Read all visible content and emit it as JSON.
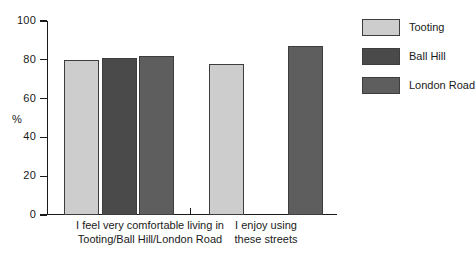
{
  "chart_data": {
    "type": "bar",
    "title": "",
    "subtitle": "",
    "xlabel": "",
    "ylabel": "%",
    "ylim": [
      0,
      100
    ],
    "ytick_labels": [
      "100",
      "80",
      "60",
      "40",
      "20",
      "0"
    ],
    "ytick_values": [
      100,
      80,
      60,
      40,
      20,
      0
    ],
    "grid": false,
    "legend_position": "right",
    "categories": [
      "I feel very comfortable living in Tooting/Ball Hill/London Road",
      "I enjoy using these streets"
    ],
    "category_lines": [
      [
        "I feel very comfortable living in",
        "Tooting/Ball Hill/London Road"
      ],
      [
        "I enjoy using",
        "these streets"
      ]
    ],
    "series": [
      {
        "name": "Tooting",
        "color": "#cdcdcd",
        "values": [
          80,
          78
        ]
      },
      {
        "name": "Ball Hill",
        "color": "#4a4a4a",
        "values": [
          81,
          null
        ]
      },
      {
        "name": "London Road",
        "color": "#5e5e5e",
        "values": [
          82,
          87
        ]
      }
    ]
  },
  "legend": {
    "items": [
      {
        "label": "Tooting"
      },
      {
        "label": "Ball Hill"
      },
      {
        "label": "London Road"
      }
    ]
  },
  "axis": {
    "y_title": "%",
    "ticks": [
      {
        "label": "100"
      },
      {
        "label": "80"
      },
      {
        "label": "60"
      },
      {
        "label": "40"
      },
      {
        "label": "20"
      },
      {
        "label": "0"
      }
    ]
  },
  "xaxis": {
    "groups": [
      {
        "line1": "I feel very comfortable living in",
        "line2": "Tooting/Ball Hill/London Road"
      },
      {
        "line1": "I enjoy using",
        "line2": "these streets"
      }
    ]
  },
  "colors": {
    "tooting": "#cdcdcd",
    "ball_hill": "#4a4a4a",
    "london_road": "#5e5e5e",
    "axis": "#1a1a1a",
    "bar_outline": "#3d3d3d",
    "background": "#ffffff"
  }
}
